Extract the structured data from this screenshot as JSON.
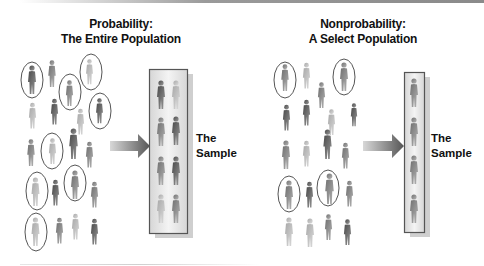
{
  "diagram": {
    "left_panel": {
      "title_line1": "Probability:",
      "title_line2": "The Entire Population",
      "sample_line1": "The",
      "sample_line2": "Sample",
      "population_count": 22,
      "circled_count": 8,
      "sample_count": 8
    },
    "right_panel": {
      "title_line1": "Nonprobability:",
      "title_line2": "A Select Population",
      "sample_line1": "The",
      "sample_line2": "Sample",
      "population_count": 18,
      "circled_count": 4,
      "sample_count": 4
    },
    "colors": {
      "figure_dark": "#5a5a5a",
      "figure_light": "#c8c8c8",
      "circle": "#555555",
      "box_border": "#555555",
      "box_fill": "#e6e6e6",
      "arrow": "#666666"
    }
  }
}
